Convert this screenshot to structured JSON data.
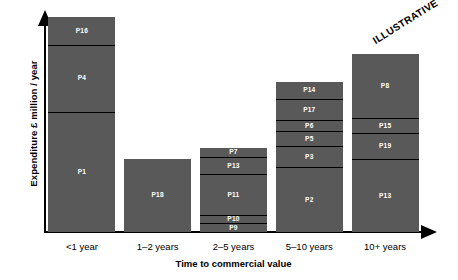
{
  "chart_data": {
    "type": "bar",
    "title": "",
    "subtitle": "",
    "xlabel": "Time to commercial value",
    "ylabel": "Expenditure £ million / year",
    "categories": [
      "<1 year",
      "1–2 years",
      "2–5 years",
      "5–10 years",
      "10+ years"
    ],
    "stacked": true,
    "grid": false,
    "legend": "none",
    "annotations": [
      "ILLUSTRATIVE"
    ],
    "ylim": [
      0,
      100
    ],
    "bars": [
      {
        "category": "<1 year",
        "total": 100,
        "segments": [
          {
            "label": "P16",
            "value": 13
          },
          {
            "label": "P4",
            "value": 31
          },
          {
            "label": "P1",
            "value": 56
          }
        ]
      },
      {
        "category": "1–2 years",
        "total": 34,
        "segments": [
          {
            "label": "P18",
            "value": 34
          }
        ]
      },
      {
        "category": "2–5 years",
        "total": 39,
        "segments": [
          {
            "label": "P7",
            "value": 4
          },
          {
            "label": "P13",
            "value": 8
          },
          {
            "label": "P11",
            "value": 19
          },
          {
            "label": "P10",
            "value": 4
          },
          {
            "label": "P9",
            "value": 4
          }
        ]
      },
      {
        "category": "5–10 years",
        "total": 70,
        "segments": [
          {
            "label": "P14",
            "value": 8
          },
          {
            "label": "P17",
            "value": 10
          },
          {
            "label": "P6",
            "value": 5
          },
          {
            "label": "P5",
            "value": 7
          },
          {
            "label": "P3",
            "value": 10
          },
          {
            "label": "P2",
            "value": 30
          }
        ]
      },
      {
        "category": "10+ years",
        "total": 83,
        "segments": [
          {
            "label": "P8",
            "value": 30
          },
          {
            "label": "P15",
            "value": 7
          },
          {
            "label": "P19",
            "value": 12
          },
          {
            "label": "P13",
            "value": 34
          }
        ]
      }
    ],
    "colors": {
      "bar_fill": "#595959",
      "bar_divider": "#000000",
      "axis": "#000000",
      "label_text": "#ffffff",
      "background": "#ffffff"
    }
  }
}
